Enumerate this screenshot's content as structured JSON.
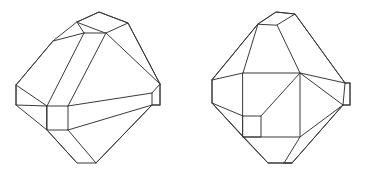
{
  "page": {
    "background_color": "#ffffff",
    "width": 370,
    "height": 174
  },
  "style": {
    "stroke_color": "#3a3a3a",
    "stroke_width": 1,
    "fill": "none"
  },
  "figures": [
    {
      "id": "left-figure",
      "label": "Left polyhedron",
      "description": "Wireframe bipyramid-like solid with truncated apex, beveled left and right vertices, a flat bottom edge, a narrow band running from the top down to a small square at the lower left, and a long band crossing to the right vertex.",
      "paths": {
        "outline": "M 77,22 L 99,12 L 128,23 L 160,84 L 160,105 L 152,105 L 96,163 L 77,163 L 47,130 L 47,106 L 16,105 L 16,85 L 53,41 Z",
        "apex_cap": "M 77,22 L 99,12 L 128,23 L 106,33 Z",
        "apex_left_edge": "M 77,22 L 84,33",
        "apex_bottom_edge": "M 84,33 L 106,33",
        "band_left": "M 84,33 L 47,106",
        "band_right": "M 106,33 L 68,106",
        "small_square": "M 47,106 L 68,106 L 68,130 L 47,130 Z",
        "band_lower_left": "M 47,130 L 77,163",
        "band_lower_right": "M 68,130 L 96,163",
        "left_vertex_top": "M 16,85 L 53,41",
        "left_vertex_edge": "M 16,85 L 16,105",
        "left_vertex_bottom": "M 16,105 L 47,130",
        "left_inner_edge": "M 16,85 L 47,106",
        "right_vertex_edge": "M 160,105 L 152,105",
        "right_vertex_upper": "M 128,23 L 160,84",
        "right_vertex_bevel": "M 160,84 L 160,105",
        "right_vertex_lower": "M 152,105 L 96,163",
        "cross_band_top": "M 68,106 L 152,93",
        "cross_band_bottom": "M 68,130 L 152,105",
        "cross_band_cap": "M 152,93 L 160,84",
        "cross_band_cap2": "M 152,93 L 152,105",
        "top_face_right": "M 106,33 L 160,84",
        "top_face_diag": "M 53,41 L 84,33"
      }
    },
    {
      "id": "right-figure",
      "label": "Right polyhedron",
      "description": "Wireframe solid in a different orientation showing a large square front face with an internal diagonal, a small square inset at the lower left of that face, truncated apex at top, beveled left and right vertices, and a flat bottom edge with a spike toward the lower right.",
      "paths": {
        "outline": "M 258,24 L 276,12 L 295,14 L 345,83 L 350,83 L 350,105 L 343,105 L 292,163 L 268,163 L 212,103 L 212,80 Z",
        "apex_cap": "M 258,24 L 276,12 L 295,14 L 277,25 Z",
        "apex_left_down": "M 258,24 L 243,73",
        "apex_right_down": "M 277,25 L 300,73",
        "top_right_edge": "M 295,14 L 345,83",
        "top_right_inner": "M 300,73 L 345,83",
        "big_square": "M 243,73 L 300,73 L 300,137 L 243,137 Z",
        "square_diagonal": "M 300,73 L 261,116",
        "small_square": "M 243,116 L 261,116 L 261,137 L 243,137 Z",
        "left_vertex_edge": "M 212,80 L 212,103",
        "left_upper_edge": "M 212,80 L 258,24",
        "left_inner_upper": "M 212,80 L 243,73",
        "left_lower_edge": "M 212,103 L 243,137",
        "left_bevel_inner": "M 212,103 L 243,116",
        "right_vertex_bevel": "M 345,83 L 350,83",
        "right_bevel_edge": "M 350,83 L 350,105",
        "right_bevel_inner": "M 343,105 L 350,105",
        "right_vertex_join": "M 345,83 L 343,105",
        "right_inner_lower": "M 300,73 L 343,105",
        "right_lower_edge": "M 343,105 L 292,163",
        "bottom_left_edge": "M 243,137 L 268,163",
        "bottom_edge": "M 268,163 L 292,163",
        "bottom_spike_left": "M 300,137 L 284,163",
        "bottom_spike_right": "M 300,137 L 343,105",
        "bottom_spike_inner": "M 284,163 L 292,163"
      }
    }
  ]
}
